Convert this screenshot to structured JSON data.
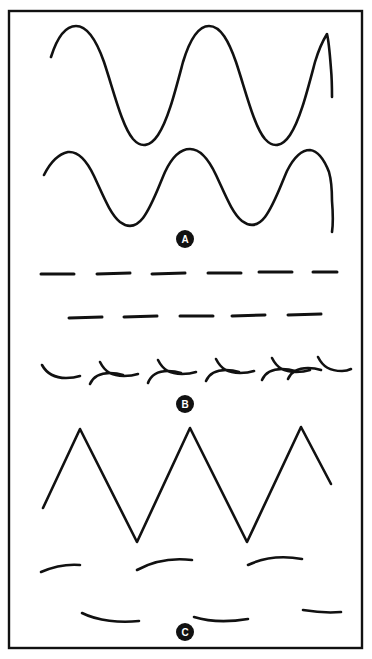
{
  "figure": {
    "background_color": "#ffffff",
    "ink_color": "#111111",
    "frame": {
      "label": "outer-frame",
      "x": 9,
      "y": 11,
      "width": 353,
      "height": 637,
      "stroke_width": 2.4,
      "stroke_color": "#111111"
    }
  },
  "sections": [
    {
      "id": "A",
      "badge": {
        "letter": "A",
        "cx": 185,
        "cy": 239,
        "r": 9,
        "fill": "#111111",
        "text_color": "#ffffff",
        "font_size": 10
      },
      "rows": [
        {
          "name": "large-sine-wave",
          "kind": "sine",
          "stroke_width": 2.6,
          "path": "M 51 57 C 57 38 65 26 76 26 C 88 26 97 42 104 62 C 114 92 122 126 133 139 C 141 148 150 147 158 135 C 168 120 175 92 183 62 C 190 39 198 26 209 26 C 221 26 229 42 236 62 C 246 92 254 126 265 139 C 273 148 282 147 290 135 C 300 120 307 92 315 62 C 318 52 322 42 327 34 C 329 42 330 56 331 69 C 332 80 332 90 332 97"
        },
        {
          "name": "medium-sine-wave",
          "kind": "sine",
          "stroke_width": 2.6,
          "path": "M 44 175 C 50 163 58 154 68 152 C 79 151 87 161 94 176 C 103 195 110 214 120 222 C 128 228 136 227 143 218 C 152 206 158 188 165 172 C 172 157 180 149 190 149 C 201 149 209 160 216 175 C 225 194 232 213 242 221 C 250 227 258 226 265 217 C 274 205 280 187 287 171 C 294 157 301 150 310 150 C 318 151 324 159 329 172 C 331 179 332 190 332 201 C 333 213 333 225 332 232"
        }
      ]
    },
    {
      "id": "B",
      "badge": {
        "letter": "B",
        "cx": 185,
        "cy": 404,
        "r": 9,
        "fill": "#111111",
        "text_color": "#ffffff",
        "font_size": 10
      },
      "rows": [
        {
          "name": "dash-row-upper",
          "kind": "straight-dashes",
          "count": 6,
          "stroke_width": 3.0,
          "y": 274,
          "dashes": [
            {
              "x1": 41,
              "x2": 74,
              "y1": 274,
              "y2": 274
            },
            {
              "x1": 97,
              "x2": 130,
              "y1": 274,
              "y2": 273
            },
            {
              "x1": 152,
              "x2": 185,
              "y1": 274,
              "y2": 273
            },
            {
              "x1": 208,
              "x2": 241,
              "y1": 273,
              "y2": 273
            },
            {
              "x1": 259,
              "x2": 292,
              "y1": 272,
              "y2": 272
            },
            {
              "x1": 313,
              "x2": 337,
              "y1": 272,
              "y2": 272
            }
          ]
        },
        {
          "name": "dash-row-lower",
          "kind": "straight-dashes",
          "count": 5,
          "stroke_width": 3.0,
          "y": 317,
          "dashes": [
            {
              "x1": 69,
              "x2": 102,
              "y1": 318,
              "y2": 317
            },
            {
              "x1": 124,
              "x2": 157,
              "y1": 317,
              "y2": 316
            },
            {
              "x1": 180,
              "x2": 213,
              "y1": 316,
              "y2": 316
            },
            {
              "x1": 232,
              "x2": 265,
              "y1": 316,
              "y2": 315
            },
            {
              "x1": 288,
              "x2": 321,
              "y1": 315,
              "y2": 314
            }
          ]
        },
        {
          "name": "hook-dash-row",
          "kind": "alternating-hooks",
          "count": 13,
          "stroke_width": 2.6,
          "hooks": [
            {
              "type": "down-hook",
              "path": "M 42 365 C 47 374 54 378 66 378 C 72 378 77 377 80 376"
            },
            {
              "type": "up-hook",
              "path": "M 90 384 C 93 377 99 373 110 373 C 116 373 120 374 123 375"
            },
            {
              "type": "down-hook",
              "path": "M 100 362 C 105 372 112 376 124 376 C 130 376 135 375 138 374"
            },
            {
              "type": "up-hook",
              "path": "M 148 383 C 151 375 157 371 168 371 C 174 371 178 372 181 373"
            },
            {
              "type": "down-hook",
              "path": "M 158 360 C 163 370 170 374 182 374 C 188 374 193 373 196 372"
            },
            {
              "type": "up-hook",
              "path": "M 206 381 C 209 374 215 370 226 370 C 232 370 236 371 239 372"
            },
            {
              "type": "down-hook",
              "path": "M 216 359 C 221 369 228 373 240 373 C 246 373 251 372 254 371"
            },
            {
              "type": "up-hook",
              "path": "M 262 380 C 265 373 271 369 282 369 C 288 369 292 370 295 371"
            },
            {
              "type": "down-hook",
              "path": "M 272 358 C 277 368 284 372 296 372 C 302 372 307 371 310 370"
            },
            {
              "type": "up-hook",
              "path": "M 288 379 C 291 372 297 368 308 368 C 314 368 318 369 321 370"
            },
            {
              "type": "down-hook",
              "path": "M 318 357 C 323 367 330 371 342 371 C 346 371 349 370 351 369"
            }
          ]
        }
      ]
    },
    {
      "id": "C",
      "badge": {
        "letter": "C",
        "cx": 185,
        "cy": 632,
        "r": 9,
        "fill": "#111111",
        "text_color": "#ffffff",
        "font_size": 10
      },
      "rows": [
        {
          "name": "triangle-wave",
          "kind": "triangle",
          "stroke_width": 2.6,
          "peaks_y": 429,
          "troughs_y": 542,
          "path": "M 43 508 L 80 429 L 137 542 L 190 428 L 247 542 L 301 427 L 331 484"
        },
        {
          "name": "arc-dash-row-upper",
          "kind": "arc-dashes",
          "count": 3,
          "stroke_width": 2.6,
          "arcs": [
            {
              "path": "M 41 572 C 55 566 68 564 80 565"
            },
            {
              "path": "M 137 570 C 155 560 175 558 192 560"
            },
            {
              "path": "M 248 565 C 265 557 285 556 302 559"
            }
          ]
        },
        {
          "name": "arc-dash-row-lower",
          "kind": "arc-dashes",
          "count": 3,
          "stroke_width": 2.6,
          "arcs": [
            {
              "path": "M 82 613 C 98 621 120 623 139 621"
            },
            {
              "path": "M 194 617 C 210 622 230 622 248 619"
            },
            {
              "path": "M 303 610 C 315 612 330 613 341 612"
            }
          ]
        }
      ]
    }
  ]
}
